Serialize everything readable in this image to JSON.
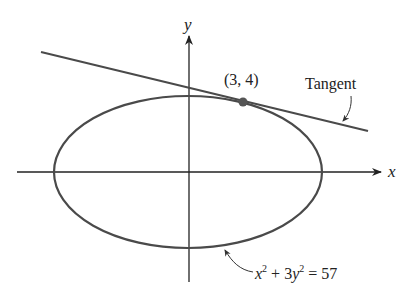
{
  "figure": {
    "type": "ellipse-with-tangent",
    "axes": {
      "x_label": "x",
      "y_label": "y"
    },
    "curve": {
      "equation_label": {
        "x": "x",
        "sup1": "2",
        "mid": " + 3",
        "y": "y",
        "sup2": "2",
        "rhs": " = 57"
      },
      "equation_text": "x^2 + 3y^2 = 57"
    },
    "point": {
      "label": "(3, 4)"
    },
    "tangent": {
      "label": "Tangent"
    },
    "colors": {
      "curve": "#4a4a4a",
      "axes": "#222222",
      "text": "#222222"
    }
  }
}
